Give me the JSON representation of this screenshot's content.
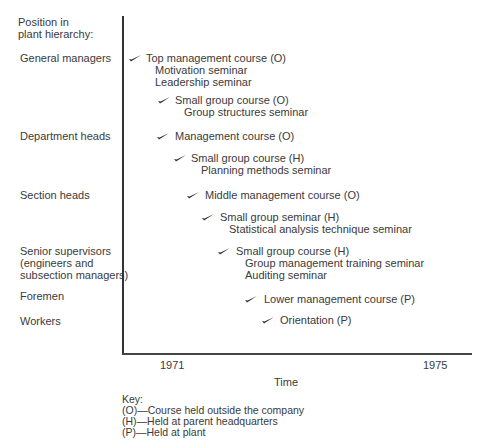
{
  "y_axis_title": [
    "Position in",
    "plant hierarchy:"
  ],
  "hierarchy_levels": [
    {
      "label": "General managers"
    },
    {
      "label": "Department heads"
    },
    {
      "label": "Section heads"
    },
    {
      "label": "Senior supervisors",
      "label2": "(engineers and",
      "label3": "subsection managers)"
    },
    {
      "label": "Foremen"
    },
    {
      "label": "Workers"
    }
  ],
  "courses": [
    {
      "title": "Top management course (O)",
      "subs": [
        "Motivation seminar",
        "Leadership seminar"
      ]
    },
    {
      "title": "Small group course (O)",
      "subs": [
        "Group structures seminar"
      ]
    },
    {
      "title": "Management course (O)",
      "subs": []
    },
    {
      "title": "Small group course (H)",
      "subs": [
        "Planning methods seminar"
      ]
    },
    {
      "title": "Middle management course (O)",
      "subs": []
    },
    {
      "title": "Small group seminar (H)",
      "subs": [
        "Statistical analysis technique seminar"
      ]
    },
    {
      "title": "Small group course (H)",
      "subs": [
        "Group management training seminar",
        "Auditing seminar"
      ]
    },
    {
      "title": "Lower management course (P)",
      "subs": []
    },
    {
      "title": "Orientation (P)",
      "subs": []
    }
  ],
  "x_axis": {
    "ticks": [
      "1971",
      "1975"
    ],
    "title": "Time"
  },
  "key": {
    "title": "Key:",
    "items": [
      "(O)—Course held outside the company",
      "(H)—Held at parent headquarters",
      "(P)—Held at plant"
    ]
  },
  "icons": {
    "marker": "check-mark-icon"
  }
}
